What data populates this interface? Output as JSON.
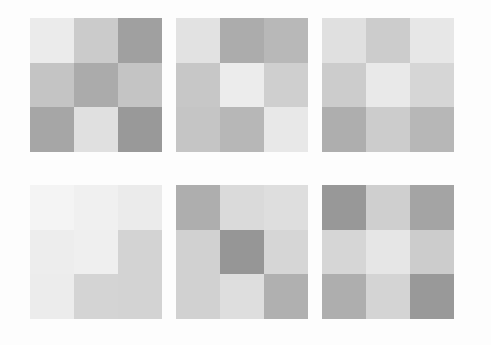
{
  "figure": {
    "title": "",
    "background_color": "#fdfdfd",
    "width": 491,
    "height": 345,
    "layout": {
      "rows": 2,
      "cols": 3,
      "panels": 6
    }
  },
  "chart_data": {
    "type": "heatmap",
    "title": "",
    "subtitle": "",
    "xlabel": "",
    "ylabel": "",
    "grid": false,
    "legend": "none",
    "colormap": "grayscale",
    "value_range": [
      0,
      1
    ],
    "note": "Six 3x3 grayscale heatmap panels arranged in a 2x3 grid of subplots. Values are normalized luminance (0 = black, 1 = white) estimated from pixel gray levels.",
    "panels": [
      {
        "index": 0,
        "name": "panel-1",
        "position": {
          "row": 0,
          "col": 0,
          "x": 30,
          "y": 18,
          "width": 132,
          "height": 134
        },
        "title": "",
        "xticklabels": [
          "0",
          "1",
          "2"
        ],
        "yticklabels": [
          "0",
          "1",
          "2"
        ],
        "values": [
          [
            0.922,
            0.796,
            0.627
          ],
          [
            0.769,
            0.671,
            0.769
          ],
          [
            0.651,
            0.878,
            0.6
          ]
        ],
        "colors": [
          [
            "#ebebeb",
            "#cbcbcb",
            "#a0a0a0"
          ],
          [
            "#c4c4c4",
            "#ababab",
            "#c4c4c4"
          ],
          [
            "#a6a6a6",
            "#e0e0e0",
            "#999999"
          ]
        ]
      },
      {
        "index": 1,
        "name": "panel-2",
        "position": {
          "row": 0,
          "col": 1,
          "x": 176,
          "y": 18,
          "width": 132,
          "height": 134
        },
        "title": "",
        "xticklabels": [
          "0",
          "1",
          "2"
        ],
        "yticklabels": [
          "0",
          "1",
          "2"
        ],
        "values": [
          [
            0.886,
            0.675,
            0.722
          ],
          [
            0.78,
            0.925,
            0.812
          ],
          [
            0.773,
            0.718,
            0.91
          ]
        ],
        "colors": [
          [
            "#e2e2e2",
            "#acacac",
            "#b8b8b8"
          ],
          [
            "#c7c7c7",
            "#ececec",
            "#cfcfcf"
          ],
          [
            "#c5c5c5",
            "#b7b7b7",
            "#e8e8e8"
          ]
        ]
      },
      {
        "index": 2,
        "name": "panel-3",
        "position": {
          "row": 0,
          "col": 2,
          "x": 322,
          "y": 18,
          "width": 132,
          "height": 134
        },
        "title": "",
        "xticklabels": [
          "0",
          "1",
          "2"
        ],
        "yticklabels": [
          "0",
          "1",
          "2"
        ],
        "values": [
          [
            0.878,
            0.8,
            0.906
          ],
          [
            0.8,
            0.914,
            0.839
          ],
          [
            0.682,
            0.8,
            0.718
          ]
        ],
        "colors": [
          [
            "#e0e0e0",
            "#cccccc",
            "#e7e7e7"
          ],
          [
            "#cccccc",
            "#e9e9e9",
            "#d6d6d6"
          ],
          [
            "#aeaeae",
            "#cccccc",
            "#b7b7b7"
          ]
        ]
      },
      {
        "index": 3,
        "name": "panel-4",
        "position": {
          "row": 1,
          "col": 0,
          "x": 30,
          "y": 185,
          "width": 132,
          "height": 134
        },
        "title": "",
        "xticklabels": [
          "0",
          "1",
          "2"
        ],
        "yticklabels": [
          "0",
          "1",
          "2"
        ],
        "values": [
          [
            0.957,
            0.941,
            0.922
          ],
          [
            0.929,
            0.937,
            0.827
          ],
          [
            0.925,
            0.831,
            0.827
          ]
        ],
        "colors": [
          [
            "#f4f4f4",
            "#f0f0f0",
            "#ebebeb"
          ],
          [
            "#ededed",
            "#efefef",
            "#d3d3d3"
          ],
          [
            "#ececec",
            "#d4d4d4",
            "#d3d3d3"
          ]
        ]
      },
      {
        "index": 4,
        "name": "panel-5",
        "position": {
          "row": 1,
          "col": 1,
          "x": 176,
          "y": 185,
          "width": 132,
          "height": 134
        },
        "title": "",
        "xticklabels": [
          "0",
          "1",
          "2"
        ],
        "yticklabels": [
          "0",
          "1",
          "2"
        ],
        "values": [
          [
            0.682,
            0.855,
            0.871
          ],
          [
            0.82,
            0.588,
            0.839
          ],
          [
            0.82,
            0.871,
            0.69
          ]
        ],
        "colors": [
          [
            "#aeaeae",
            "#dadada",
            "#dedede"
          ],
          [
            "#d1d1d1",
            "#969696",
            "#d6d6d6"
          ],
          [
            "#d1d1d1",
            "#dedede",
            "#b0b0b0"
          ]
        ]
      },
      {
        "index": 5,
        "name": "panel-6",
        "position": {
          "row": 1,
          "col": 2,
          "x": 322,
          "y": 185,
          "width": 132,
          "height": 134
        },
        "title": "",
        "xticklabels": [
          "0",
          "1",
          "2"
        ],
        "yticklabels": [
          "0",
          "1",
          "2"
        ],
        "values": [
          [
            0.596,
            0.812,
            0.643
          ],
          [
            0.839,
            0.902,
            0.8
          ],
          [
            0.682,
            0.831,
            0.6
          ]
        ],
        "colors": [
          [
            "#989898",
            "#cfcfcf",
            "#a4a4a4"
          ],
          [
            "#d6d6d6",
            "#e6e6e6",
            "#cccccc"
          ],
          [
            "#aeaeae",
            "#d4d4d4",
            "#999999"
          ]
        ]
      }
    ]
  }
}
